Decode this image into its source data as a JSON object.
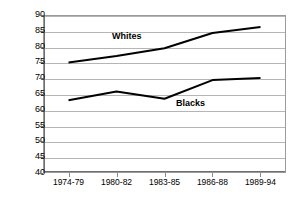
{
  "chart_data": {
    "type": "line",
    "title": "",
    "subtitle": "",
    "xlabel": "",
    "ylabel": "",
    "categories": [
      "1974-79",
      "1980-82",
      "1983-85",
      "1986-88",
      "1989-94"
    ],
    "series": [
      {
        "name": "Whites",
        "values": [
          75.0,
          77.0,
          79.5,
          84.3,
          86.2
        ],
        "color": "#000000"
      },
      {
        "name": "Blacks",
        "values": [
          63.0,
          65.8,
          63.5,
          69.4,
          70.1
        ],
        "color": "#000000"
      }
    ],
    "ylim": [
      40,
      90
    ],
    "yticks": [
      40,
      45,
      50,
      55,
      60,
      65,
      70,
      75,
      80,
      85,
      90
    ],
    "ytick_labels": [
      "40",
      "45",
      "50",
      "55",
      "60",
      "65",
      "70",
      "75",
      "80",
      "85",
      "90"
    ],
    "grid": true,
    "grid_axis": "y",
    "legend": "inline-labels",
    "legend_position": "inline",
    "annotations": [
      {
        "text": "Whites",
        "series": "Whites"
      },
      {
        "text": "Blacks",
        "series": "Blacks"
      }
    ],
    "colors": {
      "line": "#000000",
      "gridline": "#b5b5b5",
      "axis": "#6e6e6e",
      "plot_border": "#9a9a9a",
      "background": "#ffffff",
      "text": "#000000"
    }
  }
}
